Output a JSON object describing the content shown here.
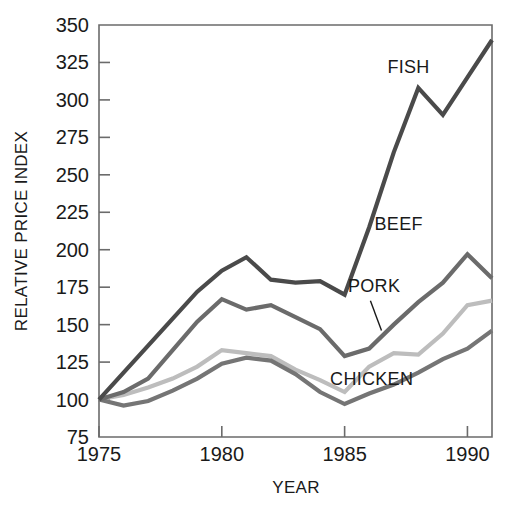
{
  "chart_data": {
    "type": "line",
    "title": "",
    "xlabel": "YEAR",
    "ylabel": "RELATIVE PRICE INDEX",
    "xlim": [
      1975,
      1991
    ],
    "ylim": [
      75,
      350
    ],
    "xticks": [
      1975,
      1980,
      1985,
      1990
    ],
    "yticks": [
      75,
      100,
      125,
      150,
      175,
      200,
      225,
      250,
      275,
      300,
      325,
      350
    ],
    "xticklabels": [
      "1975",
      "1980",
      "1985",
      "1990"
    ],
    "yticklabels": [
      "75",
      "100",
      "125",
      "150",
      "175",
      "200",
      "225",
      "250",
      "275",
      "300",
      "325",
      "350"
    ],
    "grid": false,
    "legend_position": "inline-labels",
    "x": [
      1975,
      1976,
      1977,
      1978,
      1979,
      1980,
      1981,
      1982,
      1983,
      1984,
      1985,
      1986,
      1987,
      1988,
      1989,
      1990,
      1991
    ],
    "series": [
      {
        "name": "FISH",
        "color": "#4a4a4a",
        "label": "FISH",
        "values": [
          100,
          118,
          136,
          154,
          172,
          186,
          195,
          180,
          178,
          179,
          170,
          215,
          265,
          308,
          290,
          315,
          340
        ]
      },
      {
        "name": "BEEF",
        "color": "#6b6b6b",
        "label": "BEEF",
        "values": [
          100,
          105,
          114,
          133,
          152,
          167,
          160,
          163,
          155,
          147,
          129,
          134,
          150,
          165,
          178,
          197,
          181
        ]
      },
      {
        "name": "PORK",
        "color": "#bdbdbd",
        "label": "PORK",
        "values": [
          100,
          103,
          108,
          114,
          122,
          133,
          131,
          129,
          120,
          113,
          105,
          122,
          131,
          130,
          144,
          163,
          166
        ]
      },
      {
        "name": "CHICKEN",
        "color": "#757575",
        "label": "CHICKEN",
        "values": [
          100,
          96,
          99,
          106,
          114,
          124,
          128,
          126,
          117,
          105,
          97,
          104,
          110,
          118,
          127,
          134,
          146
        ]
      }
    ],
    "annotations": [
      {
        "text": "FISH",
        "x": 1987.6,
        "y": 318
      },
      {
        "text": "BEEF",
        "x": 1987.2,
        "y": 213
      },
      {
        "text": "PORK",
        "x": 1986.2,
        "y": 172
      },
      {
        "text": "CHICKEN",
        "x": 1986.1,
        "y": 110
      }
    ]
  },
  "colors": {
    "background": "#ffffff",
    "axis": "#6b6b6b",
    "text": "#1a1a1a",
    "fish": "#4a4a4a",
    "beef": "#6b6b6b",
    "pork": "#bdbdbd",
    "chicken": "#757575"
  }
}
